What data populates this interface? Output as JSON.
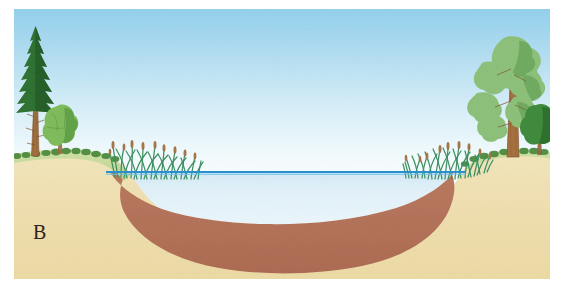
{
  "figure": {
    "panel_label": "B",
    "caption": ""
  },
  "scene": {
    "sky": {
      "name": "sky",
      "top_color": "#9ed5ee",
      "bottom_color": "#fbfeff"
    },
    "water": {
      "name": "pond-water",
      "fill_color": "#e2f1f9",
      "surface_line_color": "#2a8fd0",
      "surface_line_label": "water surface",
      "surface_y_px": 163
    },
    "sediment": {
      "name": "sediment-layer",
      "fill_color": "#b4745a",
      "edge_color": "#9c5c44",
      "label": "sediment"
    },
    "soil": {
      "name": "subsoil",
      "fill_color": "#f0dfb0",
      "edge_color": "#d9c48c",
      "label": "soil"
    },
    "turf": {
      "name": "grass-turf",
      "fill_color": "#c8dca0",
      "shade_color": "#b4cc86",
      "label": "grass"
    },
    "vegetation": {
      "conifer": {
        "name": "conifer-tree",
        "foliage_color": "#2f7233",
        "foliage_dark": "#215225",
        "trunk_color": "#9b6a43"
      },
      "deciduous_left": {
        "name": "deciduous-shrub-left",
        "foliage_color": "#79b55a",
        "foliage_dark": "#4f8c3c"
      },
      "pine_right": {
        "name": "pine-tree-right",
        "foliage_color": "#8cc07a",
        "foliage_dark": "#5e9a52",
        "trunk_color": "#a5703f"
      },
      "shrub_right": {
        "name": "shrub-right",
        "foliage_color": "#3f8a3c",
        "foliage_dark": "#2c6b2c"
      },
      "reeds_left": {
        "name": "reeds-left",
        "blade_color": "#3d8f62",
        "head_color": "#a3764a",
        "count": 26
      },
      "reeds_right": {
        "name": "reeds-right",
        "blade_color": "#3d8f62",
        "head_color": "#a3764a",
        "count": 26
      }
    }
  }
}
